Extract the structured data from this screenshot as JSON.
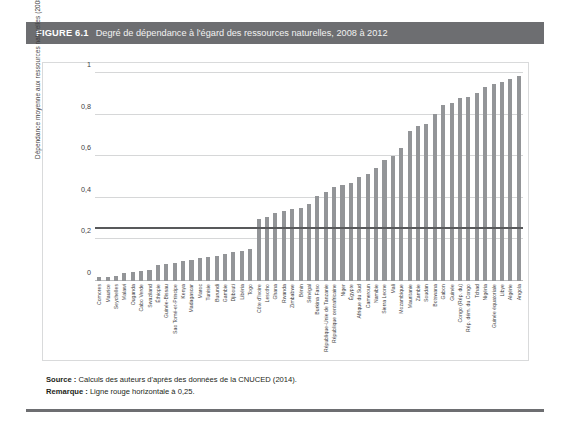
{
  "figure": {
    "number": "FIGURE 6.1",
    "title": "Degré de dépendance à l'égard des ressources naturelles, 2008 à 2012"
  },
  "footer": {
    "source_label": "Source :",
    "source_text": " Calculs des auteurs d'après des données de la CNUCED (2014).",
    "note_label": "Remarque :",
    "note_text": " Ligne rouge horizontale à 0,25."
  },
  "colors": {
    "header_bar": "#6d6e71",
    "bar_fill": "#939598",
    "reference_line": "#58595b",
    "gridline": "#d6d7d8",
    "frame": "#d9dadb"
  },
  "chart_data": {
    "type": "bar",
    "title": "Degré de dépendance à l'égard des ressources naturelles, 2008 à 2012",
    "xlabel": "",
    "ylabel": "Dépendance moyenne aux ressources naturelles (2008-2012)",
    "ylim": [
      0,
      1
    ],
    "yticks": [
      0,
      0.2,
      0.4,
      0.6,
      0.8,
      1
    ],
    "ytick_labels": [
      "0",
      "0,2",
      "0,4",
      "0,6",
      "0,8",
      "1"
    ],
    "grid": true,
    "legend": "none",
    "annotations": [
      {
        "type": "hline",
        "value": 0.25,
        "label": "Ligne rouge horizontale à 0,25",
        "color": "#58595b"
      }
    ],
    "categories": [
      "Comores",
      "Maurice",
      "Seychelles",
      "Malawi",
      "Ouganda",
      "Cabo Verde",
      "Swaziland",
      "Éthiopie",
      "Guinée-Bissau",
      "Sao Tomé-et-Principe",
      "Kenya",
      "Madagascar",
      "Maroc",
      "Tunisie",
      "Burundi",
      "Gambie",
      "Djibouti",
      "Libéria",
      "Togo",
      "Côte d'Ivoire",
      "Lesotho",
      "Ghana",
      "Rwanda",
      "Zimbabwe",
      "Bénin",
      "Sénégal",
      "Burkina Faso",
      "République-Unie de Tanzanie",
      "République centrafricaine",
      "Niger",
      "Égypte",
      "Afrique du Sud",
      "Cameroun",
      "Namibie",
      "Sierra Leone",
      "Mali",
      "Mozambique",
      "Mauritanie",
      "Zambie",
      "Soudan",
      "Botswana",
      "Gabon",
      "Guinée",
      "Congo (Rép. du)",
      "Rép. dém. du Congo",
      "Tchad",
      "Nigéria",
      "Guinée équatoriale",
      "Libye",
      "Algérie",
      "Angola"
    ],
    "values": [
      0.02,
      0.02,
      0.025,
      0.04,
      0.045,
      0.05,
      0.055,
      0.075,
      0.08,
      0.085,
      0.095,
      0.1,
      0.11,
      0.115,
      0.12,
      0.13,
      0.14,
      0.145,
      0.155,
      0.3,
      0.31,
      0.325,
      0.335,
      0.345,
      0.35,
      0.37,
      0.41,
      0.43,
      0.45,
      0.46,
      0.47,
      0.5,
      0.515,
      0.545,
      0.58,
      0.6,
      0.64,
      0.72,
      0.745,
      0.755,
      0.805,
      0.845,
      0.855,
      0.88,
      0.885,
      0.905,
      0.935,
      0.945,
      0.955,
      0.97,
      0.985
    ]
  }
}
